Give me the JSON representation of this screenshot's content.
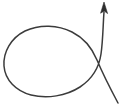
{
  "figure": {
    "kind": "line-drawing",
    "background_color": "#ffffff",
    "ink_color": "#3b3b3b",
    "arrowhead_color": "#2e2e2e",
    "stroke_width": 1.5,
    "canvas": {
      "width": 124,
      "height": 106
    },
    "crossing_point": {
      "x": 96,
      "y": 57
    },
    "arrow_tip": {
      "x": 104,
      "y": 2
    },
    "tail_end": {
      "x": 118,
      "y": 103
    },
    "loop_extents": {
      "left": 4,
      "top": 27,
      "right": 99,
      "bottom": 97
    },
    "path_d": "M 118 103 C 110 88, 102 72, 97 60 C 92 48, 84 38, 72 32 C 58 25, 40 24, 25 31 C 11 38, 3 52, 4 66 C 5 80, 16 91, 31 95 C 47 99, 66 96, 80 87 C 92 79, 99 68, 101 54 C 103 40, 103 25, 104 12",
    "arrowhead_d": "M 104 2 L 100.6 13.2 L 104.2 11.0 L 107.6 13.6 Z"
  }
}
